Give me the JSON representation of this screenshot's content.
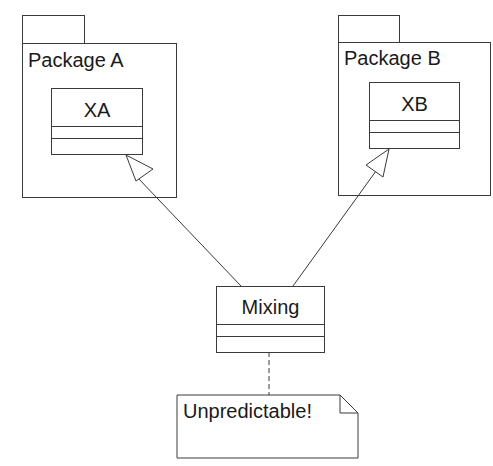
{
  "diagram": {
    "type": "UML class/package diagram",
    "packages": [
      {
        "id": "pkg-a",
        "label": "Package A",
        "classes": [
          {
            "name": "XA"
          }
        ]
      },
      {
        "id": "pkg-b",
        "label": "Package B",
        "classes": [
          {
            "name": "XB"
          }
        ]
      }
    ],
    "classes": [
      {
        "name": "Mixing"
      }
    ],
    "relationships": [
      {
        "type": "generalization",
        "from": "Mixing",
        "to": "XA"
      },
      {
        "type": "generalization",
        "from": "Mixing",
        "to": "XB"
      },
      {
        "type": "note-anchor",
        "from": "Mixing",
        "to": "note"
      }
    ],
    "note": {
      "text": "Unpredictable!"
    }
  },
  "colors": {
    "line": "#3a3a3a",
    "background": "#ffffff",
    "text": "#1a1a1a"
  }
}
